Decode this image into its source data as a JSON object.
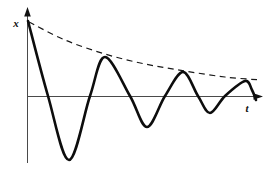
{
  "figure": {
    "background_color": "#ffffff",
    "axis": {
      "vertical_label": "x",
      "horizontal_label": "t",
      "line_color": "#4a4a4a",
      "arrow_color": "#121212"
    },
    "geometry": {
      "width": 279,
      "height": 176,
      "vertical_axis": {
        "x": 27.5,
        "y_tip": 7,
        "y_line_top": 15,
        "y_bottom": 163
      },
      "horizontal_axis": {
        "y": 96.5,
        "x_left": 27.5,
        "x_line_right": 254,
        "x_tip": 263
      },
      "vertical_label_pos": {
        "x": 16,
        "y": 27
      },
      "horizontal_label_pos": {
        "x": 247,
        "y": 112
      }
    },
    "curve": {
      "semantic": "damped-oscillation",
      "color": "#0d0d0d",
      "stroke_width": 2.6,
      "points": [
        [
          28,
          21
        ],
        [
          48,
          96
        ],
        [
          69,
          160
        ],
        [
          90,
          96
        ],
        [
          105,
          57
        ],
        [
          130,
          96
        ],
        [
          147,
          127
        ],
        [
          165,
          96
        ],
        [
          183,
          72
        ],
        [
          198,
          96
        ],
        [
          210,
          113
        ],
        [
          225,
          96
        ],
        [
          245,
          81
        ],
        [
          252,
          90
        ],
        [
          256,
          100
        ]
      ]
    },
    "envelope": {
      "semantic": "exponential-decay-envelope",
      "color": "#191919",
      "stroke_width": 1.2,
      "dash": "6 4.5",
      "points": [
        [
          29,
          22
        ],
        [
          65,
          40
        ],
        [
          105,
          54
        ],
        [
          145,
          64
        ],
        [
          185,
          71
        ],
        [
          225,
          77
        ],
        [
          261,
          80
        ]
      ]
    }
  }
}
